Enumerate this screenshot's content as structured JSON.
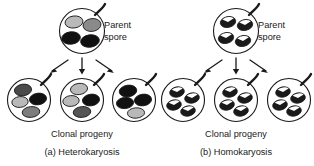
{
  "figure": {
    "background_color": "#ffffff",
    "outline_color": "#1a1a1a",
    "panels": [
      {
        "id": "panel-a",
        "caption": "(a) Heterokaryosis",
        "progeny_label": "Clonal progeny",
        "parent_label_line1": "Parent",
        "parent_label_line2": "spore",
        "parent_spore": {
          "name": "parent-spore-heterokaryotic",
          "nuclei": [
            {
              "pos": "top-left",
              "fill": "#b9b9b9",
              "pattern": "solid"
            },
            {
              "pos": "top-right",
              "fill": "#8a8a8a",
              "pattern": "solid"
            },
            {
              "pos": "bottom-left",
              "fill": "#111111",
              "pattern": "solid"
            },
            {
              "pos": "bottom-right",
              "fill": "#111111",
              "pattern": "solid"
            }
          ]
        },
        "progeny": [
          {
            "name": "progeny-spore-1",
            "nuclei": [
              {
                "fill": "#4a4a4a",
                "pattern": "solid"
              },
              {
                "fill": "#b9b9b9",
                "pattern": "solid"
              },
              {
                "fill": "#111111",
                "pattern": "solid"
              },
              {
                "fill": "#7d7d7d",
                "pattern": "solid"
              }
            ]
          },
          {
            "name": "progeny-spore-2",
            "nuclei": [
              {
                "fill": "#b9b9b9",
                "pattern": "solid"
              },
              {
                "fill": "#b9b9b9",
                "pattern": "solid"
              },
              {
                "fill": "#111111",
                "pattern": "solid"
              },
              {
                "fill": "#555555",
                "pattern": "solid"
              }
            ]
          },
          {
            "name": "progeny-spore-3",
            "nuclei": [
              {
                "fill": "#111111",
                "pattern": "solid"
              },
              {
                "fill": "#111111",
                "pattern": "solid"
              },
              {
                "fill": "#111111",
                "pattern": "solid"
              },
              {
                "fill": "#b9b9b9",
                "pattern": "solid"
              }
            ]
          }
        ]
      },
      {
        "id": "panel-b",
        "caption": "(b) Homokaryosis",
        "progeny_label": "Clonal progeny",
        "parent_label_line1": "Parent",
        "parent_label_line2": "spore",
        "parent_spore": {
          "name": "parent-spore-homokaryotic",
          "nuclei": [
            {
              "pos": "top-left",
              "fill": "#1a1a1a",
              "pattern": "wedge"
            },
            {
              "pos": "top-right",
              "fill": "#1a1a1a",
              "pattern": "wedge"
            },
            {
              "pos": "bottom-left",
              "fill": "#1a1a1a",
              "pattern": "wedge"
            },
            {
              "pos": "bottom-right",
              "fill": "#1a1a1a",
              "pattern": "wedge"
            }
          ]
        },
        "progeny": [
          {
            "name": "progeny-spore-1",
            "nuclei": [
              {
                "fill": "#1a1a1a",
                "pattern": "wedge"
              },
              {
                "fill": "#1a1a1a",
                "pattern": "wedge"
              },
              {
                "fill": "#1a1a1a",
                "pattern": "wedge"
              },
              {
                "fill": "#1a1a1a",
                "pattern": "wedge"
              }
            ]
          },
          {
            "name": "progeny-spore-2",
            "nuclei": [
              {
                "fill": "#1a1a1a",
                "pattern": "wedge"
              },
              {
                "fill": "#1a1a1a",
                "pattern": "wedge"
              },
              {
                "fill": "#1a1a1a",
                "pattern": "wedge"
              },
              {
                "fill": "#1a1a1a",
                "pattern": "wedge"
              }
            ]
          },
          {
            "name": "progeny-spore-3",
            "nuclei": [
              {
                "fill": "#1a1a1a",
                "pattern": "wedge"
              },
              {
                "fill": "#1a1a1a",
                "pattern": "wedge"
              },
              {
                "fill": "#1a1a1a",
                "pattern": "wedge"
              },
              {
                "fill": "#1a1a1a",
                "pattern": "wedge"
              }
            ]
          }
        ]
      }
    ]
  }
}
